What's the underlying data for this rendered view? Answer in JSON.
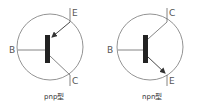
{
  "diagrams": [
    {
      "name": "pnp",
      "caption": "pnp型",
      "terminals": {
        "base": "B",
        "emitter": "E",
        "collector": "C"
      },
      "arrow": "toward-base"
    },
    {
      "name": "npn",
      "caption": "npn型",
      "terminals": {
        "base": "B",
        "collector": "C",
        "emitter": "E"
      },
      "arrow": "away-from-base"
    }
  ],
  "colors": {
    "line": "#666666",
    "bar": "#222222",
    "circle": "#777777",
    "text": "#555555"
  }
}
